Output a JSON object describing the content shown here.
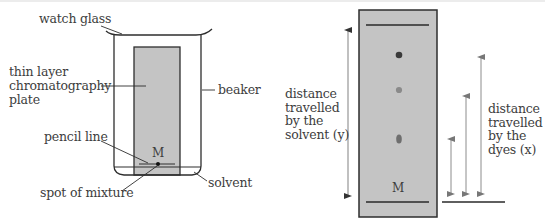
{
  "left_diagram": {
    "title": "chromatography apparatus",
    "labels": {
      "watch_glass": "watch glass",
      "tlc_plate": "thin layer\nchromatography\nplate",
      "beaker": "beaker",
      "pencil_line": "pencil line",
      "spot_of_mixture": "spot of mixture",
      "solvent": "solvent",
      "mixture_marker": "M"
    }
  },
  "right_diagram": {
    "title": "developed chromatogram",
    "labels": {
      "solvent_distance": "distance\ntravelled\nby the\nsolvent (y)",
      "dye_distance": "distance\ntravelled\nby the\ndyes (x)",
      "mixture_marker": "M"
    },
    "spots": [
      {
        "name": "dye-spot-1",
        "color": "#3a3a3a",
        "shape": "circle"
      },
      {
        "name": "dye-spot-2",
        "color": "#8a8a8a",
        "shape": "circle"
      },
      {
        "name": "dye-spot-3",
        "color": "#6e6e6e",
        "shape": "oval"
      }
    ]
  },
  "colors": {
    "plate_fill": "#c4c4c4",
    "line": "#2e2e2e",
    "arrow": "#8c8c8c",
    "text": "#3d3d3d"
  }
}
